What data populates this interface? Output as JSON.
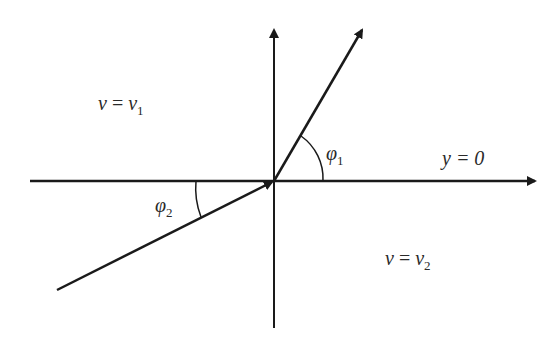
{
  "diagram": {
    "type": "refraction-angle-diagram",
    "colors": {
      "line": "#1a1a1a",
      "text": "#2a2a2a",
      "background": "#ffffff"
    },
    "labels": {
      "region1": {
        "lhs": "v",
        "eq": " = ",
        "rhs": "v",
        "sub": "1"
      },
      "region2": {
        "lhs": "v",
        "eq": " = ",
        "rhs": "v",
        "sub": "2"
      },
      "angle1": {
        "sym": "φ",
        "sub": "1"
      },
      "angle2": {
        "sym": "φ",
        "sub": "2"
      },
      "axis": "y = 0"
    },
    "elements": {
      "horizontal_axis": "y = 0 boundary line with arrow to right",
      "vertical_axis": "vertical normal line with arrow upward",
      "incident_ray": "ray from lower-left to origin",
      "refracted_ray": "ray from origin to upper-right"
    }
  }
}
